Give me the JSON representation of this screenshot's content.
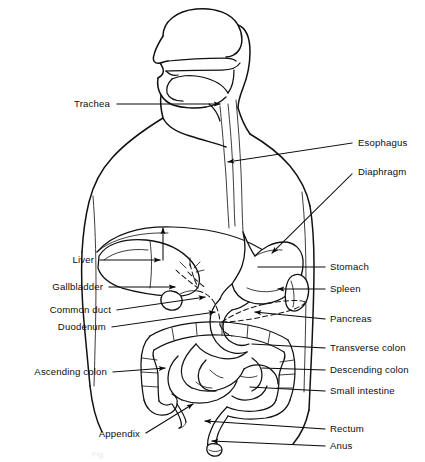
{
  "figure": {
    "caption_faint": "Fig.",
    "line_color": "#111111",
    "background_color": "#ffffff"
  },
  "labels_left": [
    {
      "id": "trachea",
      "text": "Trachea",
      "text_x": 110,
      "text_y": 107,
      "lead_x1": 117,
      "lead_y1": 104,
      "lead_x2": 220,
      "lead_y2": 104,
      "arrow": true
    },
    {
      "id": "liver",
      "text": "Liver",
      "text_x": 94,
      "text_y": 263,
      "lead_x1": 100,
      "lead_y1": 260,
      "lead_x2": 160,
      "lead_y2": 260,
      "arrow": true
    },
    {
      "id": "gallbladder",
      "text": "Gallbladder",
      "text_x": 103,
      "text_y": 290,
      "lead_x1": 109,
      "lead_y1": 287,
      "lead_x2": 175,
      "lead_y2": 287,
      "arrow": true
    },
    {
      "id": "common-duct",
      "text": "Common duct",
      "text_x": 111,
      "text_y": 313,
      "lead_x1": 117,
      "lead_y1": 310,
      "lead_x2": 205,
      "lead_y2": 297,
      "arrow": true
    },
    {
      "id": "duodenum",
      "text": "Duodenum",
      "text_x": 106,
      "text_y": 330,
      "lead_x1": 112,
      "lead_y1": 327,
      "lead_x2": 215,
      "lead_y2": 312,
      "arrow": true
    },
    {
      "id": "ascending-colon",
      "text": "Ascending colon",
      "text_x": 107,
      "text_y": 375,
      "lead_x1": 113,
      "lead_y1": 372,
      "lead_x2": 165,
      "lead_y2": 368,
      "arrow": true
    },
    {
      "id": "appendix",
      "text": "Appendix",
      "text_x": 140,
      "text_y": 437,
      "lead_x1": 146,
      "lead_y1": 433,
      "lead_x2": 193,
      "lead_y2": 404,
      "arrow": true
    }
  ],
  "labels_right": [
    {
      "id": "esophagus",
      "text": "Esophagus",
      "text_x": 358,
      "text_y": 146,
      "lead_x1": 352,
      "lead_y1": 143,
      "lead_x2": 228,
      "lead_y2": 162,
      "arrow": true
    },
    {
      "id": "diaphragm",
      "text": "Diaphragm",
      "text_x": 358,
      "text_y": 175,
      "lead_x1": 352,
      "lead_y1": 174,
      "lead_x2": 272,
      "lead_y2": 253,
      "arrow": true
    },
    {
      "id": "stomach",
      "text": "Stomach",
      "text_x": 330,
      "text_y": 270,
      "lead_x1": 325,
      "lead_y1": 267,
      "lead_x2": 258,
      "lead_y2": 267,
      "arrow": false
    },
    {
      "id": "spleen",
      "text": "Spleen",
      "text_x": 330,
      "text_y": 292,
      "lead_x1": 325,
      "lead_y1": 289,
      "lead_x2": 278,
      "lead_y2": 289,
      "arrow": true
    },
    {
      "id": "pancreas",
      "text": "Pancreas",
      "text_x": 330,
      "text_y": 322,
      "lead_x1": 325,
      "lead_y1": 319,
      "lead_x2": 255,
      "lead_y2": 312,
      "arrow": true
    },
    {
      "id": "transverse-colon",
      "text": "Transverse colon",
      "text_x": 330,
      "text_y": 351,
      "lead_x1": 325,
      "lead_y1": 348,
      "lead_x2": 252,
      "lead_y2": 344,
      "arrow": false
    },
    {
      "id": "descending-colon",
      "text": "Descending colon",
      "text_x": 330,
      "text_y": 373,
      "lead_x1": 325,
      "lead_y1": 370,
      "lead_x2": 262,
      "lead_y2": 368,
      "arrow": false
    },
    {
      "id": "small-intestine",
      "text": "Small intestine",
      "text_x": 330,
      "text_y": 394,
      "lead_x1": 325,
      "lead_y1": 391,
      "lead_x2": 250,
      "lead_y2": 387,
      "arrow": false
    },
    {
      "id": "rectum",
      "text": "Rectum",
      "text_x": 330,
      "text_y": 432,
      "lead_x1": 325,
      "lead_y1": 429,
      "lead_x2": 205,
      "lead_y2": 421,
      "arrow": true
    },
    {
      "id": "anus",
      "text": "Anus",
      "text_x": 330,
      "text_y": 449,
      "lead_x1": 325,
      "lead_y1": 446,
      "lead_x2": 212,
      "lead_y2": 441,
      "arrow": true
    }
  ]
}
